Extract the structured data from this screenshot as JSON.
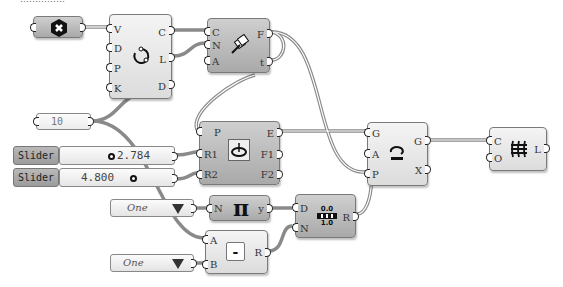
{
  "canvas": {
    "top_text_partial": "……………",
    "wire_color": "#8a8a8a"
  },
  "nodes": {
    "param_vector": {
      "icon": "hexagon-x-icon"
    },
    "circle_node": {
      "inputs": [
        "V",
        "D",
        "P",
        "K"
      ],
      "outputs": [
        "C",
        "L",
        "D"
      ],
      "icon": "circle-dots-icon"
    },
    "frames_node": {
      "inputs": [
        "C",
        "N",
        "A"
      ],
      "outputs": [
        "F",
        "t"
      ],
      "icon": "perp-frames-icon"
    },
    "panel_10": {
      "value": "10"
    },
    "slider1": {
      "label": "Slider",
      "value": "2.784"
    },
    "slider2": {
      "label": "Slider",
      "value": "4.800"
    },
    "ellipse_node": {
      "inputs": [
        "P",
        "R1",
        "R2"
      ],
      "outputs": [
        "E",
        "F1",
        "F2"
      ],
      "icon": "ellipse-icon"
    },
    "orient_node": {
      "inputs": [
        "G",
        "A",
        "P"
      ],
      "outputs": [
        "G",
        "X"
      ],
      "icon": "rotate-icon"
    },
    "loft_node": {
      "inputs": [
        "C",
        "O"
      ],
      "outputs": [
        "L"
      ],
      "icon": "loft-icon"
    },
    "dropdown1": {
      "value": "One"
    },
    "dropdown2": {
      "value": "One"
    },
    "pi_node": {
      "inputs": [
        "N"
      ],
      "outputs": [
        "y"
      ],
      "symbol": "π"
    },
    "range_node": {
      "inputs": [
        "D",
        "N"
      ],
      "outputs": [
        "R"
      ],
      "icon_top": "0.0",
      "icon_bottom": "1.0"
    },
    "subtract_node": {
      "inputs": [
        "A",
        "B"
      ],
      "outputs": [
        "R"
      ],
      "symbol": "-"
    }
  }
}
